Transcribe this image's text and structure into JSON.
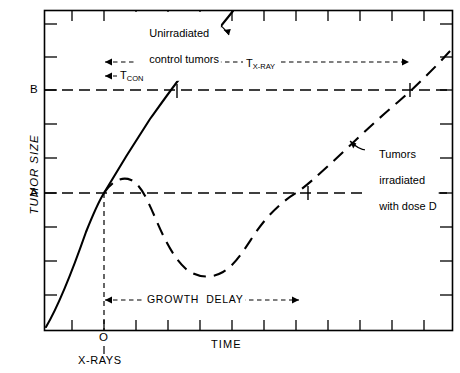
{
  "figure": {
    "type": "line",
    "axes": {
      "y_title": "TUMOR SIZE",
      "x_title": "TIME",
      "origin_label": "O",
      "origin_sub_label": "X-RAYS",
      "y_tick_labels": [
        "A",
        "B"
      ]
    },
    "annotations": {
      "control_curve": {
        "line1": "Unirradiated",
        "line2": "control tumors"
      },
      "irradiated_curve": {
        "line1": "Tumors",
        "line2": "irradiated",
        "line3": "with dose D"
      },
      "t_con": {
        "base": "T",
        "sub": "CON"
      },
      "t_xray": {
        "base": "T",
        "sub": "X-RAY"
      },
      "growth_delay": "GROWTH  DELAY"
    }
  },
  "chart_data": {
    "type": "line",
    "title": "",
    "xlabel": "TIME",
    "ylabel": "TUMOR SIZE",
    "grid": false,
    "legend": "annotations",
    "xlim": [
      0,
      13
    ],
    "ylim": [
      0,
      10
    ],
    "reference_lines": [
      {
        "label": "A",
        "axis": "y",
        "value": 4.2,
        "style": "dashed"
      },
      {
        "label": "B",
        "axis": "y",
        "value": 7.5,
        "style": "dashed"
      },
      {
        "label": "O",
        "axis": "x",
        "value": 1.85,
        "style": "dashed"
      }
    ],
    "series": [
      {
        "name": "Unirradiated control tumors",
        "style": "solid",
        "x": [
          0.05,
          0.6,
          1.2,
          1.85,
          2.6,
          3.4,
          4.2,
          5.0,
          5.9
        ],
        "y": [
          0.15,
          1.5,
          2.9,
          4.2,
          5.7,
          7.0,
          8.1,
          9.1,
          10.0
        ]
      },
      {
        "name": "Tumors irradiated with dose D",
        "style": "dashed",
        "x": [
          1.85,
          2.4,
          3.0,
          3.7,
          4.5,
          5.3,
          6.1,
          6.9,
          7.7,
          8.6,
          9.6,
          10.6,
          11.6,
          12.7,
          13.0
        ],
        "y": [
          4.2,
          4.7,
          4.6,
          3.9,
          2.8,
          1.8,
          1.25,
          1.25,
          1.9,
          2.9,
          4.0,
          5.2,
          6.4,
          7.7,
          8.1
        ]
      }
    ],
    "intervals": [
      {
        "label": "T_CON",
        "from_x": 1.85,
        "to_x": 4.2,
        "at_y": 8.0,
        "arrows": "both"
      },
      {
        "label": "T_X-RAY",
        "from_x": 1.85,
        "to_x": 11.6,
        "at_y": 8.55,
        "arrows": "both"
      },
      {
        "label": "GROWTH DELAY",
        "from_x": 1.85,
        "to_x": 8.2,
        "at_y": 1.1,
        "arrows": "both"
      }
    ]
  }
}
